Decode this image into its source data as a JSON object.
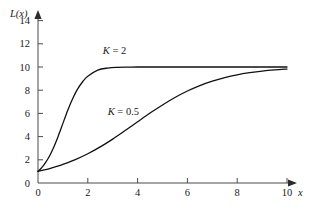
{
  "figure": {
    "background_color": "#ffffff",
    "axis_color": "#4a4a4a",
    "curve_color": "#111111"
  },
  "chart_data": {
    "type": "line",
    "title": "",
    "xlabel": "x",
    "ylabel": "L(x)",
    "xlim": [
      0,
      10.4
    ],
    "ylim": [
      0,
      15
    ],
    "grid": false,
    "legend_position": "inline-annotations",
    "x_ticks": [
      0,
      2,
      4,
      6,
      8,
      10
    ],
    "x_tick_labels": [
      "0",
      "2",
      "4",
      "6",
      "8",
      "10"
    ],
    "y_ticks": [
      0,
      2,
      4,
      6,
      8,
      10,
      12,
      14
    ],
    "y_tick_labels": [
      "0",
      "2",
      "4",
      "6",
      "8",
      "10",
      "12",
      "14"
    ],
    "asymptote": 10,
    "initial_value": 1,
    "annotations": [
      {
        "text_k": "K",
        "text_eq": " = ",
        "text_val": "2",
        "full": "K = 2",
        "x": 2.6,
        "y": 11.1
      },
      {
        "text_k": "K",
        "text_eq": " = ",
        "text_val": "0.5",
        "full": "K = 0.5",
        "x": 2.8,
        "y": 5.9
      }
    ],
    "series": [
      {
        "name": "K = 2",
        "k": 2,
        "x": [
          0,
          0.1,
          0.2,
          0.3,
          0.4,
          0.5,
          0.6,
          0.7,
          0.8,
          0.9,
          1.0,
          1.2,
          1.4,
          1.6,
          1.8,
          2.0,
          2.4,
          2.8,
          3.2,
          3.6,
          4.0,
          4.5,
          5.0,
          5.5,
          6.0,
          6.5,
          7.0,
          7.5,
          8.0,
          8.5,
          9.0,
          9.5,
          10.0
        ],
        "y": [
          1.0,
          1.21,
          1.46,
          1.75,
          2.09,
          2.48,
          2.93,
          3.43,
          3.97,
          4.55,
          5.14,
          6.3,
          7.31,
          8.13,
          8.75,
          9.2,
          9.73,
          9.91,
          9.97,
          9.99,
          10.0,
          10.0,
          10.0,
          10.0,
          10.0,
          10.0,
          10.0,
          10.0,
          10.0,
          10.0,
          10.0,
          10.0,
          10.0
        ]
      },
      {
        "name": "K = 0.5",
        "k": 0.5,
        "x": [
          0,
          0.25,
          0.5,
          0.75,
          1.0,
          1.5,
          2.0,
          2.5,
          3.0,
          3.5,
          4.0,
          4.5,
          5.0,
          5.5,
          6.0,
          6.5,
          7.0,
          7.5,
          8.0,
          8.5,
          9.0,
          9.5,
          10.0
        ],
        "y": [
          1.0,
          1.13,
          1.27,
          1.43,
          1.61,
          2.02,
          2.52,
          3.11,
          3.78,
          4.52,
          5.28,
          6.03,
          6.73,
          7.37,
          7.93,
          8.4,
          8.78,
          9.09,
          9.33,
          9.51,
          9.65,
          9.75,
          9.82
        ]
      }
    ]
  },
  "axes": {
    "y_axis_title": "L(x)",
    "x_axis_title": "x",
    "y_axis_arrow": "up-arrow",
    "x_axis_arrow": "right-arrow"
  }
}
